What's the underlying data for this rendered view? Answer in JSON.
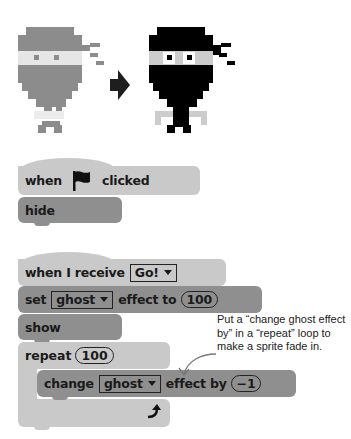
{
  "illustration": {
    "before_sprite": "ghosted-ninja-sprite",
    "arrow": "right-arrow",
    "after_sprite": "ninja-sprite",
    "colors": {
      "ghost": "#8c8c8c",
      "ghost_band": "#e4e4e4",
      "ninja": "#000000",
      "ninja_band": "#c8c8c8",
      "arrow": "#1e1e1e"
    }
  },
  "script1": {
    "hat": {
      "when": "when",
      "icon": "green-flag-icon",
      "clicked": "clicked"
    },
    "blocks": [
      {
        "label": "hide"
      }
    ]
  },
  "script2": {
    "hat": {
      "label": "when I receive",
      "message": "Go!"
    },
    "set": {
      "label": "set",
      "effect": "ghost",
      "to": "effect to",
      "value": "100"
    },
    "show": {
      "label": "show"
    },
    "repeat": {
      "label": "repeat",
      "value": "100",
      "loop_icon": "loop-arrow-icon"
    },
    "change": {
      "label": "change",
      "effect": "ghost",
      "by": "effect by",
      "value": "−1"
    }
  },
  "annotation": {
    "text": "Put a “change ghost effect by” in a “repeat” loop to make a sprite fade in."
  },
  "colors": {
    "light_block": "#c9c9c9",
    "dark_block": "#8f8f8f",
    "text": "#1a1a1a"
  }
}
